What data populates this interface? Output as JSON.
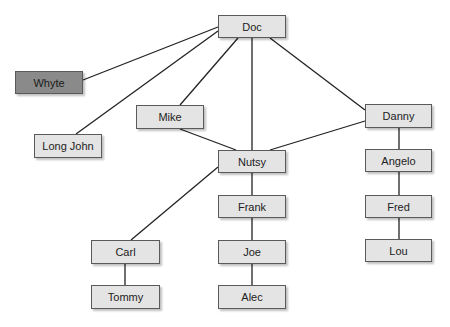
{
  "diagram": {
    "type": "network",
    "colors": {
      "node_fill": "#e4e4e4",
      "highlight_fill": "#8a8a8a",
      "edge": "#222222"
    },
    "nodes": [
      {
        "id": "doc",
        "label": "Doc",
        "x": 218,
        "y": 15,
        "w": 68,
        "h": 23
      },
      {
        "id": "whyte",
        "label": "Whyte",
        "x": 15,
        "y": 71,
        "w": 68,
        "h": 23,
        "highlight": true
      },
      {
        "id": "longjohn",
        "label": "Long John",
        "x": 34,
        "y": 134,
        "w": 68,
        "h": 24
      },
      {
        "id": "mike",
        "label": "Mike",
        "x": 136,
        "y": 105,
        "w": 68,
        "h": 24
      },
      {
        "id": "danny",
        "label": "Danny",
        "x": 365,
        "y": 104,
        "w": 67,
        "h": 24
      },
      {
        "id": "nutsy",
        "label": "Nutsy",
        "x": 218,
        "y": 150,
        "w": 68,
        "h": 23
      },
      {
        "id": "angelo",
        "label": "Angelo",
        "x": 365,
        "y": 149,
        "w": 67,
        "h": 23
      },
      {
        "id": "frank",
        "label": "Frank",
        "x": 218,
        "y": 195,
        "w": 68,
        "h": 23
      },
      {
        "id": "fred",
        "label": "Fred",
        "x": 365,
        "y": 195,
        "w": 67,
        "h": 23
      },
      {
        "id": "carl",
        "label": "Carl",
        "x": 91,
        "y": 240,
        "w": 69,
        "h": 24
      },
      {
        "id": "joe",
        "label": "Joe",
        "x": 218,
        "y": 240,
        "w": 68,
        "h": 24
      },
      {
        "id": "lou",
        "label": "Lou",
        "x": 365,
        "y": 239,
        "w": 67,
        "h": 23
      },
      {
        "id": "tommy",
        "label": "Tommy",
        "x": 91,
        "y": 285,
        "w": 69,
        "h": 24
      },
      {
        "id": "alec",
        "label": "Alec",
        "x": 218,
        "y": 285,
        "w": 68,
        "h": 24
      }
    ],
    "edges": [
      {
        "from": "doc",
        "to": "whyte",
        "x1": 218,
        "y1": 27,
        "x2": 83,
        "y2": 80
      },
      {
        "from": "doc",
        "to": "longjohn",
        "x1": 218,
        "y1": 31,
        "x2": 76,
        "y2": 134
      },
      {
        "from": "doc",
        "to": "mike",
        "x1": 238,
        "y1": 38,
        "x2": 180,
        "y2": 105
      },
      {
        "from": "doc",
        "to": "nutsy",
        "x1": 252,
        "y1": 38,
        "x2": 252,
        "y2": 150
      },
      {
        "from": "doc",
        "to": "danny",
        "x1": 270,
        "y1": 38,
        "x2": 365,
        "y2": 110
      },
      {
        "from": "mike",
        "to": "nutsy",
        "x1": 180,
        "y1": 129,
        "x2": 236,
        "y2": 150
      },
      {
        "from": "danny",
        "to": "nutsy",
        "x1": 365,
        "y1": 121,
        "x2": 270,
        "y2": 150
      },
      {
        "from": "nutsy",
        "to": "carl",
        "x1": 218,
        "y1": 167,
        "x2": 131,
        "y2": 240
      },
      {
        "from": "nutsy",
        "to": "frank",
        "x1": 252,
        "y1": 173,
        "x2": 252,
        "y2": 195
      },
      {
        "from": "frank",
        "to": "joe",
        "x1": 252,
        "y1": 218,
        "x2": 252,
        "y2": 240
      },
      {
        "from": "joe",
        "to": "alec",
        "x1": 252,
        "y1": 264,
        "x2": 252,
        "y2": 285
      },
      {
        "from": "carl",
        "to": "tommy",
        "x1": 125,
        "y1": 264,
        "x2": 125,
        "y2": 285
      },
      {
        "from": "danny",
        "to": "angelo",
        "x1": 399,
        "y1": 128,
        "x2": 399,
        "y2": 149
      },
      {
        "from": "angelo",
        "to": "fred",
        "x1": 399,
        "y1": 172,
        "x2": 399,
        "y2": 195
      },
      {
        "from": "fred",
        "to": "lou",
        "x1": 399,
        "y1": 218,
        "x2": 399,
        "y2": 239
      }
    ]
  }
}
